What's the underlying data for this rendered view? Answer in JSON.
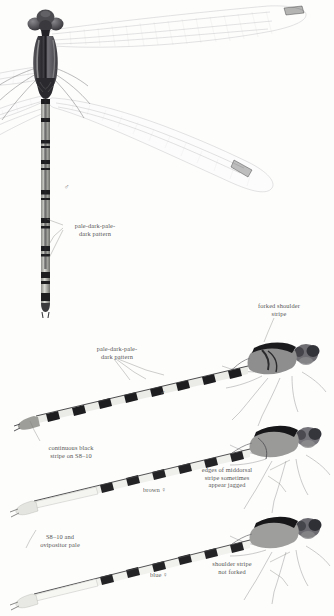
{
  "plate": {
    "title": "Spotted Spreadwing plate",
    "background_color": "#fdfdfc",
    "ink_color": "#3a3a38",
    "leader_color": "#7d7d7a"
  },
  "annotations": [
    {
      "id": "pale-dark-pale-dark-pattern-top",
      "text": "pale-dark-pale-\ndark pattern",
      "x": 64,
      "y": 222,
      "width": 62,
      "align": "center"
    },
    {
      "id": "forked-shoulder-stripe",
      "text": "forked shoulder\nstripe",
      "x": 244,
      "y": 302,
      "width": 70,
      "align": "center"
    },
    {
      "id": "pale-dark-pale-dark-pattern-mid",
      "text": "pale-dark-pale-\ndark pattern",
      "x": 86,
      "y": 345,
      "width": 62,
      "align": "center"
    },
    {
      "id": "continuous-black-stripe",
      "text": "continuous black\nstripe on S8–10",
      "x": 32,
      "y": 444,
      "width": 78,
      "align": "center"
    },
    {
      "id": "edges-of-middorsal-stripe",
      "text": "edges of middorsal\nstripe sometimes\nappear jagged",
      "x": 186,
      "y": 466,
      "width": 82,
      "align": "center"
    },
    {
      "id": "s8-10-and-ovipositor-pale",
      "text": "S8–10 and\novipositor pale",
      "x": 22,
      "y": 533,
      "width": 76,
      "align": "center"
    },
    {
      "id": "shoulder-stripe-not-forked",
      "text": "shoulder stripe\nnot forked",
      "x": 196,
      "y": 560,
      "width": 72,
      "align": "center"
    }
  ],
  "sex_marks": [
    {
      "id": "male-symbol-top",
      "symbol": "♂",
      "x": 64,
      "y": 184
    },
    {
      "id": "male-symbol-mid",
      "symbol": "♂",
      "x": 160,
      "y": 390
    }
  ],
  "sex_labels": [
    {
      "id": "brown-female-label",
      "text": "brown ♀",
      "x": 143,
      "y": 486
    },
    {
      "id": "blue-female-label",
      "text": "blue ♀",
      "x": 150,
      "y": 571
    }
  ],
  "specimens": [
    {
      "id": "specimen-male-dorsal",
      "view": "dorsal",
      "sex": "male",
      "caption": "♂",
      "description": "whole damselfly, dorsal view, wings spread"
    },
    {
      "id": "specimen-male-lateral",
      "view": "lateral",
      "sex": "male",
      "caption": "♂",
      "description": "head, thorax and abdomen, lateral view"
    },
    {
      "id": "specimen-female-brown",
      "view": "lateral",
      "sex": "female",
      "caption": "brown ♀",
      "description": "brown female, lateral view"
    },
    {
      "id": "specimen-female-blue",
      "view": "lateral",
      "sex": "female",
      "caption": "blue ♀",
      "description": "blue female, lateral view"
    }
  ]
}
